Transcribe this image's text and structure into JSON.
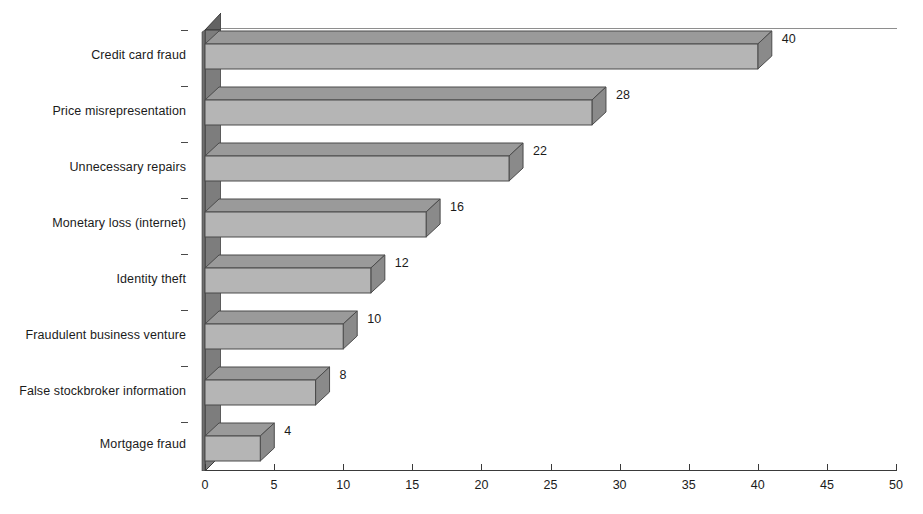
{
  "chart_data": {
    "type": "bar",
    "orientation": "horizontal",
    "style": "3d",
    "title": "",
    "subtitle": "",
    "xlabel": "",
    "ylabel": "",
    "categories": [
      "Credit card fraud",
      "Price misrepresentation",
      "Unnecessary repairs",
      "Monetary loss (internet)",
      "Identity theft",
      "Fraudulent business venture",
      "False stockbroker information",
      "Mortgage fraud"
    ],
    "values": [
      40,
      28,
      22,
      16,
      12,
      10,
      8,
      4
    ],
    "data_labels": [
      "40",
      "28",
      "22",
      "16",
      "12",
      "10",
      "8",
      "4"
    ],
    "xlim": [
      0,
      50
    ],
    "xticks": [
      0,
      5,
      10,
      15,
      20,
      25,
      30,
      35,
      40,
      45,
      50
    ],
    "xtick_labels": [
      "0",
      "5",
      "10",
      "15",
      "20",
      "25",
      "30",
      "35",
      "40",
      "45",
      "50"
    ],
    "grid": false,
    "legend": null,
    "legend_position": "none",
    "colors": {
      "bar_face": "#b5b5b5",
      "bar_top": "#9a9a9a",
      "bar_side": "#8a8a8a",
      "bar_outline": "#4a4a4a",
      "wall": "#7d7d7d",
      "wall_top": "#636363",
      "wall_outline": "#3a3a3a",
      "axis": "#3a3a3a",
      "text": "#1b1b1b",
      "background": "#ffffff"
    }
  }
}
